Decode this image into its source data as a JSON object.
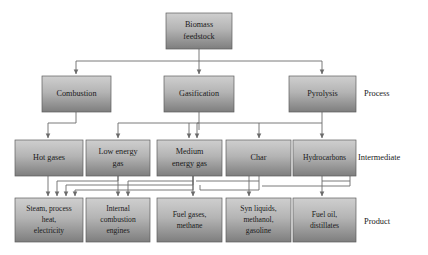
{
  "diagram": {
    "tier_labels": [
      {
        "id": "process",
        "text": "Process"
      },
      {
        "id": "intermediate",
        "text": "Intermediate"
      },
      {
        "id": "product",
        "text": "Product"
      }
    ],
    "colors": {
      "box_top": "#c9c9c9",
      "box_bottom": "#808080",
      "box_border": "#5d5d5d",
      "connector": "#6b6b6b",
      "text": "#1a1a1a",
      "background": "#ffffff"
    },
    "nodes": {
      "feedstock": {
        "line1": "Biomass",
        "line2": "feedstock"
      },
      "combustion": {
        "line1": "Combustion",
        "line2": ""
      },
      "gasification": {
        "line1": "Gasification",
        "line2": ""
      },
      "pyrolysis": {
        "line1": "Pyrolysis",
        "line2": ""
      },
      "hot_gases": {
        "line1": "Hot gases",
        "line2": ""
      },
      "low_energy_gas": {
        "line1": "Low energy",
        "line2": "gas"
      },
      "medium_energy_gas": {
        "line1": "Medium",
        "line2": "energy gas"
      },
      "char": {
        "line1": "Char",
        "line2": ""
      },
      "hydrocarbons": {
        "line1": "Hydrocarbons",
        "line2": ""
      },
      "steam_heat_electricity": {
        "line1": "Steam, process",
        "line2": "heat,",
        "line3": "electricity"
      },
      "internal_combustion_engines": {
        "line1": "Internal",
        "line2": "combustion",
        "line3": "engines"
      },
      "fuel_gases_methane": {
        "line1": "Fuel gases,",
        "line2": "methane",
        "line3": ""
      },
      "syn_liquids": {
        "line1": "Syn liquids,",
        "line2": "methanol,",
        "line3": "gasoline"
      },
      "fuel_oil_distillates": {
        "line1": "Fuel oil,",
        "line2": "distillates",
        "line3": ""
      }
    }
  }
}
